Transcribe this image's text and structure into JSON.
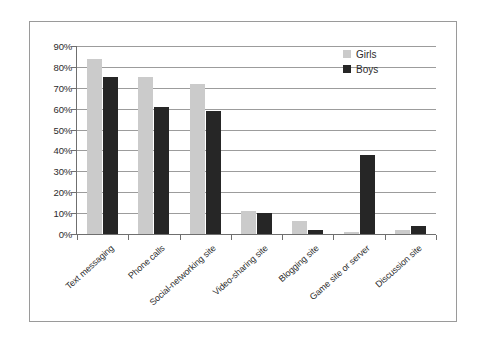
{
  "chart_data": {
    "type": "bar",
    "title": "",
    "subtitle": "",
    "xlabel": "",
    "ylabel": "",
    "ylim": [
      0,
      90
    ],
    "ytick_labels": [
      "0%",
      "10%",
      "20%",
      "30%",
      "40%",
      "50%",
      "60%",
      "70%",
      "80%",
      "90%"
    ],
    "ytick_values": [
      0,
      10,
      20,
      30,
      40,
      50,
      60,
      70,
      80,
      90
    ],
    "grid": true,
    "legend_position": "top-right",
    "categories": [
      "Text messaging",
      "Phone calls",
      "Social-networking site",
      "Video-sharing site",
      "Blogging site",
      "Game site or server",
      "Discussion site"
    ],
    "series": [
      {
        "name": "Girls",
        "color": "#cbcbcb",
        "values": [
          84,
          75,
          72,
          11,
          6,
          1,
          2
        ]
      },
      {
        "name": "Boys",
        "color": "#262626",
        "values": [
          75,
          61,
          59,
          10,
          2,
          38,
          4
        ]
      }
    ]
  },
  "legend": {
    "entries": [
      {
        "label": "Girls",
        "swatch": "girls"
      },
      {
        "label": "Boys",
        "swatch": "boys"
      }
    ]
  },
  "colors": {
    "girls": "#cbcbcb",
    "boys": "#262626",
    "axis": "#6f6f6f",
    "grid": "#9c9c9c",
    "frame": "#9a9a9a",
    "text": "#2b2b2b",
    "background": "#ffffff"
  }
}
